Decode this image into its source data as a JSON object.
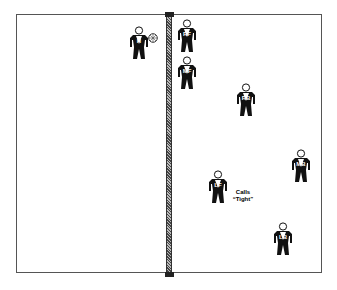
{
  "diagram": {
    "type": "volleyball-court",
    "net": {
      "orientation": "vertical"
    },
    "ball": {
      "icon": "volleyball-icon",
      "near_player": "H"
    },
    "players": [
      {
        "label": "H",
        "side": "left",
        "x": 128,
        "y": 26
      },
      {
        "label": "RF",
        "side": "right",
        "x": 176,
        "y": 19
      },
      {
        "label": "MF",
        "side": "right",
        "x": 176,
        "y": 56
      },
      {
        "label": "RB",
        "side": "right",
        "x": 235,
        "y": 83
      },
      {
        "label": "MB",
        "side": "right",
        "x": 290,
        "y": 149
      },
      {
        "label": "LF",
        "side": "right",
        "x": 207,
        "y": 170
      },
      {
        "label": "LB",
        "side": "right",
        "x": 272,
        "y": 222
      }
    ],
    "annotation": {
      "line1": "Calls",
      "line2": "“Tight”",
      "near_player": "LF"
    }
  }
}
